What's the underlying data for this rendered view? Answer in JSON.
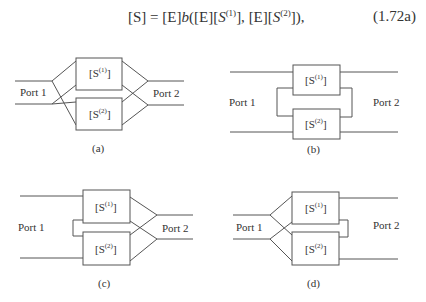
{
  "equation": {
    "lhs": "[S]",
    "equals": "=",
    "rhs_prefix": "[E]",
    "func": "b",
    "arg1_E": "[E]",
    "arg1_S_base": "S",
    "arg1_S_sup": "(1)",
    "arg2_E": "[E]",
    "arg2_S_base": "S",
    "arg2_S_sup": "(2)",
    "number": "(1.72a)"
  },
  "panels": [
    {
      "id": "a",
      "caption": "(a)",
      "port_left": "Port 1",
      "port_right": "Port 2",
      "box1_base": "[S",
      "box1_sup": "(1)",
      "box1_end": "]",
      "box2_base": "[S",
      "box2_sup": "(2)",
      "box2_end": "]",
      "connection": "left-branch-cross, right-branch-cross"
    },
    {
      "id": "b",
      "caption": "(b)",
      "port_left": "Port 1",
      "port_right": "Port 2",
      "box1_base": "[S",
      "box1_sup": "(1)",
      "box1_end": "]",
      "box2_base": "[S",
      "box2_sup": "(2)",
      "box2_end": "]",
      "connection": "series-left-loop, series-right-loop"
    },
    {
      "id": "c",
      "caption": "(c)",
      "port_left": "Port 1",
      "port_right": "Port 2",
      "box1_base": "[S",
      "box1_sup": "(1)",
      "box1_end": "]",
      "box2_base": "[S",
      "box2_sup": "(2)",
      "box2_end": "]",
      "connection": "left-loop, right-branch-cross"
    },
    {
      "id": "d",
      "caption": "(d)",
      "port_left": "Port 1",
      "port_right": "Port 2",
      "box1_base": "[S",
      "box1_sup": "(1)",
      "box1_end": "]",
      "box2_base": "[S",
      "box2_sup": "(2)",
      "box2_end": "]",
      "connection": "left-branch-cross, right-loop"
    }
  ]
}
